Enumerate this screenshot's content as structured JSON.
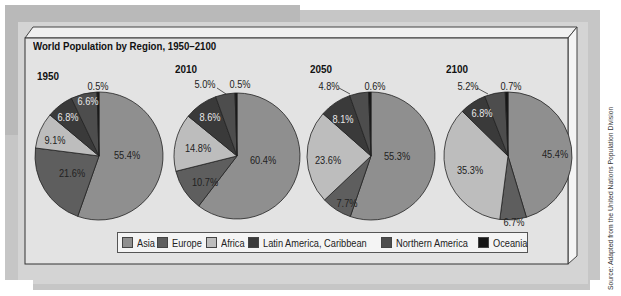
{
  "chart_data": {
    "type": "pie",
    "title": "World Population by Region, 1950–2100",
    "legend": {
      "position": "bottom",
      "entries": [
        "Asia",
        "Europe",
        "Africa",
        "Latin America, Caribbean",
        "Northern America",
        "Oceania"
      ]
    },
    "categories": [
      "Asia",
      "Europe",
      "Africa",
      "Latin America, Caribbean",
      "Northern America",
      "Oceania"
    ],
    "colors": [
      "#8f8f8f",
      "#5e5e5e",
      "#bdbdbd",
      "#3a3a3a",
      "#4d4d4d",
      "#161616"
    ],
    "series": [
      {
        "name": "1950",
        "values": [
          55.4,
          21.6,
          9.1,
          6.8,
          6.6,
          0.5
        ],
        "labels": [
          "55.4%",
          "21.6%",
          "9.1%",
          "6.8%",
          "6.6%",
          "0.5%"
        ]
      },
      {
        "name": "2010",
        "values": [
          60.4,
          10.7,
          14.8,
          8.6,
          5.0,
          0.5
        ],
        "labels": [
          "60.4%",
          "10.7%",
          "14.8%",
          "8.6%",
          "5.0%",
          "0.5%"
        ]
      },
      {
        "name": "2050",
        "values": [
          55.3,
          7.7,
          23.6,
          8.1,
          4.8,
          0.6
        ],
        "labels": [
          "55.3%",
          "7.7%",
          "23.6%",
          "8.1%",
          "4.8%",
          "0.6%"
        ]
      },
      {
        "name": "2100",
        "values": [
          45.4,
          6.7,
          35.3,
          6.8,
          5.2,
          0.7
        ],
        "labels": [
          "45.4%",
          "6.7%",
          "35.3%",
          "6.8%",
          "5.2%",
          "0.7%"
        ]
      }
    ],
    "source": "Source: Adapted from the United Nations Population Division"
  }
}
